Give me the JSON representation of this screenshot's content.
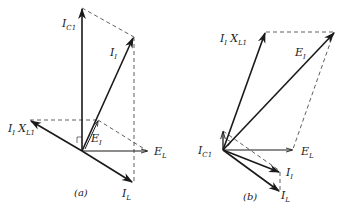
{
  "diagram_a": {
    "caption": "(a)",
    "labels": {
      "I_C1": {
        "main": "I",
        "sub": "C1"
      },
      "I_I": {
        "main": "I",
        "sub": "I"
      },
      "I_I_X_L1": {
        "main": "I",
        "sub": "I",
        "main2": "X",
        "sub2": "L1"
      },
      "E_I": {
        "main": "E",
        "sub": "I"
      },
      "E_L": {
        "main": "E",
        "sub": "L"
      },
      "I_L": {
        "main": "I",
        "sub": "L"
      }
    }
  },
  "diagram_b": {
    "caption": "(b)",
    "labels": {
      "I_I_X_L1": {
        "main": "I",
        "sub": "I",
        "main2": "X",
        "sub2": "L1"
      },
      "E_I": {
        "main": "E",
        "sub": "I"
      },
      "I_C1": {
        "main": "I",
        "sub": "C1"
      },
      "E_L": {
        "main": "E",
        "sub": "L"
      },
      "I_I": {
        "main": "I",
        "sub": "I"
      },
      "I_L": {
        "main": "I",
        "sub": "L"
      }
    }
  },
  "colors": {
    "ink": "#1a1a1a",
    "background": "#ffffff"
  }
}
